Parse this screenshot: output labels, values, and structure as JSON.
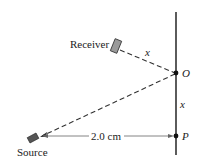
{
  "diagram": {
    "labels": {
      "receiver": "Receiver",
      "source": "Source",
      "point_o": "O",
      "point_p": "P",
      "distance_receiver_o": "x",
      "distance_o_p": "x",
      "distance_source_p": "2.0 cm"
    },
    "colors": {
      "line": "#333333",
      "device_fill": "#9a9a9a",
      "source_fill": "#555555"
    }
  }
}
